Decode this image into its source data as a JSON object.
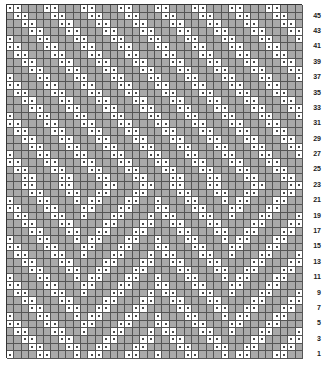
{
  "chart": {
    "title": "",
    "type": "knitting-stitch-chart",
    "rows": 46,
    "columns": 40,
    "colors": {
      "knit_cell": "#a9a9a9",
      "purl_cell": "#ffffff",
      "grid_line": "#555555",
      "dot": "#111111"
    },
    "legend": {
      "white_dot_cell": "purl",
      "grey_cell": "knit"
    },
    "row_labels": [
      "45",
      "43",
      "41",
      "39",
      "37",
      "35",
      "33",
      "31",
      "29",
      "27",
      "25",
      "23",
      "21",
      "19",
      "17",
      "15",
      "13",
      "11",
      "9",
      "7",
      "5",
      "3",
      "1"
    ],
    "pattern_rule": "pairs of purl cells along diagonals with period 5; chevrons in lower section, down-right diagonals in upper section"
  },
  "chart_data": {
    "type": "table",
    "xlabel": "",
    "ylabel": "Row",
    "y_ticks": [
      1,
      3,
      5,
      7,
      9,
      11,
      13,
      15,
      17,
      19,
      21,
      23,
      25,
      27,
      29,
      31,
      33,
      35,
      37,
      39,
      41,
      43,
      45
    ]
  }
}
